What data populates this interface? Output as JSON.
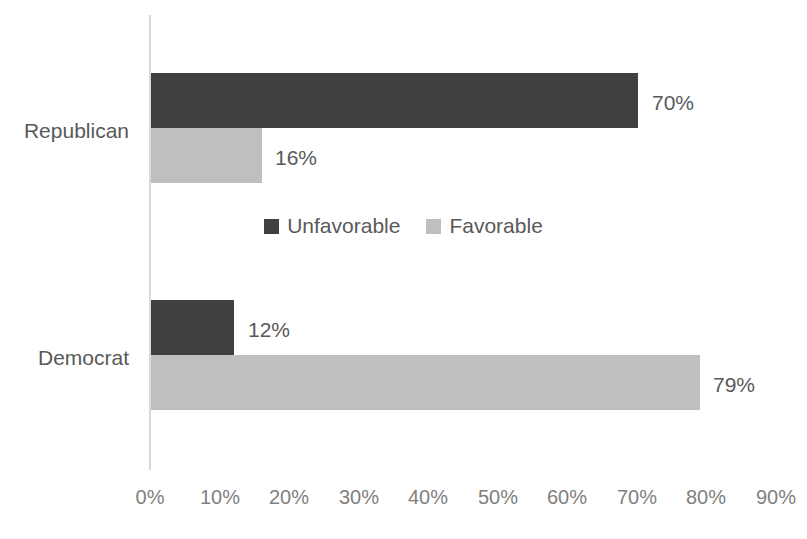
{
  "chart_data": {
    "type": "bar",
    "orientation": "horizontal",
    "title": "",
    "subtitle": "",
    "xlabel": "",
    "ylabel": "",
    "categories": [
      "Republican",
      "Democrat"
    ],
    "series": [
      {
        "name": "Unfavorable",
        "color": "#404040",
        "values": [
          70,
          12
        ],
        "data_labels": [
          "70%",
          "16%"
        ]
      },
      {
        "name": "Favorable",
        "color": "#bfbfbf",
        "values": [
          16,
          79
        ],
        "data_labels": [
          "12%",
          "79%"
        ]
      }
    ],
    "points": [
      {
        "category": "Republican",
        "series": "Unfavorable",
        "value": 70,
        "label": "70%"
      },
      {
        "category": "Republican",
        "series": "Favorable",
        "value": 16,
        "label": "16%"
      },
      {
        "category": "Democrat",
        "series": "Unfavorable",
        "value": 12,
        "label": "12%"
      },
      {
        "category": "Democrat",
        "series": "Favorable",
        "value": 79,
        "label": "79%"
      }
    ],
    "xlim": [
      0,
      90
    ],
    "xtick_step": 10,
    "xtick_labels": [
      "0%",
      "10%",
      "20%",
      "30%",
      "40%",
      "50%",
      "60%",
      "70%",
      "80%",
      "90%"
    ],
    "grid": false,
    "legend_position": "center",
    "axis_color": "#d9d9d9",
    "text_color": "#595959",
    "background": "#ffffff"
  },
  "legend": {
    "entries": [
      {
        "label": "Unfavorable",
        "color": "#404040"
      },
      {
        "label": "Favorable",
        "color": "#bfbfbf"
      }
    ]
  },
  "labels": {
    "republican": "Republican",
    "democrat": "Democrat",
    "rep_unfavorable": "70%",
    "rep_favorable": "16%",
    "dem_unfavorable": "12%",
    "dem_favorable": "79%"
  },
  "ticks": {
    "t0": "0%",
    "t1": "10%",
    "t2": "20%",
    "t3": "30%",
    "t4": "40%",
    "t5": "50%",
    "t6": "60%",
    "t7": "70%",
    "t8": "80%",
    "t9": "90%"
  }
}
